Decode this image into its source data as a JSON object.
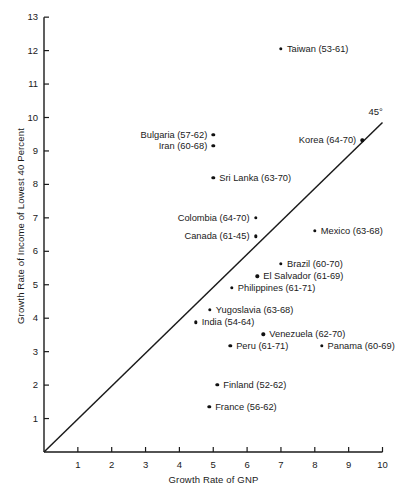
{
  "chart_data": {
    "type": "scatter",
    "title": "",
    "xlabel": "Growth Rate of GNP",
    "ylabel": "Growth Rate of Income of Lowest 40 Percent",
    "xlim": [
      0,
      10
    ],
    "ylim": [
      0,
      13
    ],
    "xticks": [
      "1",
      "2",
      "3",
      "4",
      "5",
      "6",
      "7",
      "8",
      "9",
      "10"
    ],
    "xtick_values": [
      1,
      2,
      3,
      4,
      5,
      6,
      7,
      8,
      9,
      10
    ],
    "yticks": [
      "1",
      "2",
      "3",
      "4",
      "5",
      "6",
      "7",
      "8",
      "9",
      "10",
      "11",
      "12",
      "13"
    ],
    "ytick_values": [
      1,
      2,
      3,
      4,
      5,
      6,
      7,
      8,
      9,
      10,
      11,
      12,
      13
    ],
    "grid": false,
    "legend": null,
    "annotations": [
      {
        "name": "forty-five-degree-line",
        "label": "45°",
        "type": "reference-line",
        "from": [
          0,
          0
        ],
        "to": [
          10,
          9.85
        ]
      }
    ],
    "points": [
      {
        "label": "Taiwan (53-61)",
        "x": 7.0,
        "y": 12.05,
        "label_side": "right"
      },
      {
        "label": "Bulgaria (57-62)",
        "x": 5.0,
        "y": 9.48,
        "label_side": "left"
      },
      {
        "label": "Iran (60-68)",
        "x": 5.0,
        "y": 9.15,
        "label_side": "left"
      },
      {
        "label": "Korea (64-70)",
        "x": 9.4,
        "y": 9.32,
        "label_side": "left"
      },
      {
        "label": "Sri Lanka (63-70)",
        "x": 5.0,
        "y": 8.2,
        "label_side": "right"
      },
      {
        "label": "Colombia (64-70)",
        "x": 6.25,
        "y": 7.0,
        "label_side": "left"
      },
      {
        "label": "Canada (61-45)",
        "x": 6.25,
        "y": 6.45,
        "label_side": "left"
      },
      {
        "label": "Mexico (63-68)",
        "x": 8.0,
        "y": 6.62,
        "label_side": "right"
      },
      {
        "label": "Brazil (60-70)",
        "x": 7.0,
        "y": 5.62,
        "label_side": "right"
      },
      {
        "label": "El Salvador (61-69)",
        "x": 6.3,
        "y": 5.25,
        "label_side": "right"
      },
      {
        "label": "Philippines (61-71)",
        "x": 5.55,
        "y": 4.9,
        "label_side": "right"
      },
      {
        "label": "Yugoslavia (63-68)",
        "x": 4.9,
        "y": 4.25,
        "label_side": "right"
      },
      {
        "label": "India (54-64)",
        "x": 4.48,
        "y": 3.88,
        "label_side": "right"
      },
      {
        "label": "Venezuela (62-70)",
        "x": 6.48,
        "y": 3.52,
        "label_side": "right"
      },
      {
        "label": "Peru (61-71)",
        "x": 5.5,
        "y": 3.18,
        "label_side": "right"
      },
      {
        "label": "Panama (60-69)",
        "x": 8.2,
        "y": 3.18,
        "label_side": "right"
      },
      {
        "label": "Finland (52-62)",
        "x": 5.12,
        "y": 2.0,
        "label_side": "right"
      },
      {
        "label": "France (56-62)",
        "x": 4.88,
        "y": 1.35,
        "label_side": "right"
      }
    ]
  }
}
